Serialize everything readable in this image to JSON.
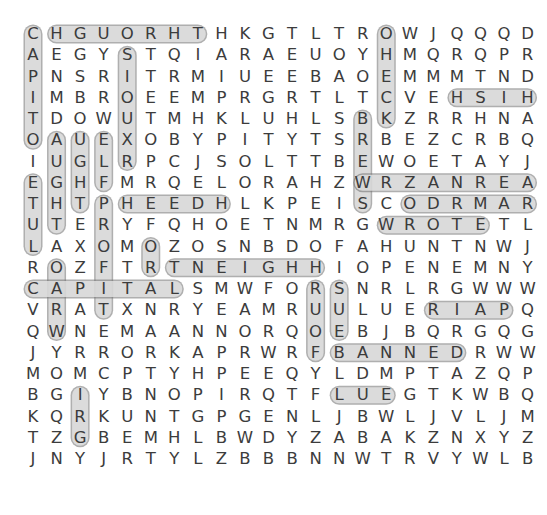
{
  "puzzle": {
    "type": "word-search",
    "cols": 22,
    "rows": 22,
    "cell_width": 23.55,
    "cell_height": 21.25,
    "origin_x": 33,
    "origin_y": 34,
    "grid": [
      "CHGUORHTHKGTLTROWJQQQDK",
      "AEGYSTQIARAEUOYHMQRQPRG",
      "PNSRITRMIUEEBAOEMMMTNDM",
      "IMBROEEMPRGRTLTCVEHSIHP",
      "TDOWUTMHKLUHLSBKZRRHNAY",
      "OAUEXOBYPITYTSRBEZCRBQV",
      "IUGLRPCJSOLTTBEWOETAYJY",
      "EGHFMRQELORAHZWRZANREAL",
      "THTPHEEDHLKPEISCODRMARY",
      "UTERYFQHOETNMRGWROTETLJ",
      "LAXOMOZOSNBDOFAHUNTNWJB",
      "ROZFTRTNEIGHHIOPENEMNYN",
      "CAPITALSMWFORSNRLRGWWWY",
      "VRATXNRYEAMRUULUERIAPQT",
      "QWNEMAANNORQOEBJBQRGQGR",
      "JYRRORKAPRWRFBANNEDRWWG",
      "MOMCPTYHPEEQYLDMPTAZQPL",
      "BGIYBNOPIRQTFLUEGTKWBQM",
      "KQRKUNTGPGENLJBWLJVLJMB",
      "TZGBEMHLBWDYZABAKZNXYZX",
      "JNYJRTYLZBBBNNWTRVYWLBN"
    ]
  },
  "found_words": [
    "CAPITAL",
    "CAPITOL",
    "HGUORHT",
    "STUPID",
    "WORLD",
    "CHECK",
    "HISTORY",
    "NEIGHBOR",
    "BANNED",
    "FLUE",
    "PATRIOT",
    "MARY",
    "REAL",
    "WROTE",
    "BUS",
    "FLOOD",
    "SUE",
    "HEED",
    "GIRL",
    "LIBERTY"
  ],
  "colors": {
    "text": "#3c3c3c",
    "highlight_fill": "#c8c8c8",
    "highlight_stroke": "#6e6e6e",
    "background": "#ffffff"
  },
  "highlights": [
    {
      "r1": 0,
      "c1": 0,
      "r2": 5,
      "c2": 0
    },
    {
      "r1": 0,
      "c1": 1,
      "r2": 0,
      "c2": 7
    },
    {
      "r1": 1,
      "c1": 4,
      "r2": 6,
      "c2": 4
    },
    {
      "r1": 0,
      "c1": 15,
      "r2": 4,
      "c2": 15
    },
    {
      "r1": 3,
      "c1": 18,
      "r2": 3,
      "c2": 21
    },
    {
      "r1": 4,
      "c1": 14,
      "r2": 8,
      "c2": 14
    },
    {
      "r1": 5,
      "c1": 1,
      "r2": 9,
      "c2": 1
    },
    {
      "r1": 5,
      "c1": 2,
      "r2": 8,
      "c2": 2
    },
    {
      "r1": 5,
      "c1": 3,
      "r2": 7,
      "c2": 3
    },
    {
      "r1": 7,
      "c1": 0,
      "r2": 10,
      "c2": 0
    },
    {
      "r1": 8,
      "c1": 3,
      "r2": 13,
      "c2": 3
    },
    {
      "r1": 10,
      "c1": 5,
      "r2": 11,
      "c2": 5
    },
    {
      "r1": 11,
      "c1": 1,
      "r2": 14,
      "c2": 1
    },
    {
      "r1": 12,
      "c1": 0,
      "r2": 12,
      "c2": 6
    },
    {
      "r1": 11,
      "c1": 6,
      "r2": 11,
      "c2": 12
    },
    {
      "r1": 12,
      "c1": 13,
      "r2": 14,
      "c2": 13
    },
    {
      "r1": 12,
      "c1": 12,
      "r2": 15,
      "c2": 12
    },
    {
      "r1": 13,
      "c1": 17,
      "r2": 13,
      "c2": 20
    },
    {
      "r1": 15,
      "c1": 13,
      "r2": 15,
      "c2": 18
    },
    {
      "r1": 17,
      "c1": 13,
      "r2": 17,
      "c2": 15
    },
    {
      "r1": 17,
      "c1": 2,
      "r2": 19,
      "c2": 2
    },
    {
      "r1": 7,
      "c1": 14,
      "r2": 7,
      "c2": 21
    },
    {
      "r1": 8,
      "c1": 16,
      "r2": 8,
      "c2": 21
    },
    {
      "r1": 9,
      "c1": 15,
      "r2": 9,
      "c2": 19
    },
    {
      "r1": 8,
      "c1": 4,
      "r2": 8,
      "c2": 8
    }
  ]
}
